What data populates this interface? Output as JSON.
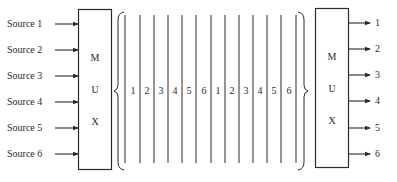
{
  "diagram": {
    "type": "time-division multiplexing",
    "inputs": [
      "Source 1",
      "Source 2",
      "Source 3",
      "Source 4",
      "Source 5",
      "Source 6"
    ],
    "input_mux": {
      "letters": [
        "M",
        "U",
        "X"
      ]
    },
    "frame_slots": [
      "1",
      "2",
      "3",
      "4",
      "5",
      "6",
      "1",
      "2",
      "3",
      "4",
      "5",
      "6"
    ],
    "output_mux": {
      "letters": [
        "M",
        "U",
        "X"
      ]
    },
    "outputs": [
      "1",
      "2",
      "3",
      "4",
      "5",
      "6"
    ],
    "colors": {
      "line": "#2a2a2a",
      "background": "#ffffff"
    }
  }
}
